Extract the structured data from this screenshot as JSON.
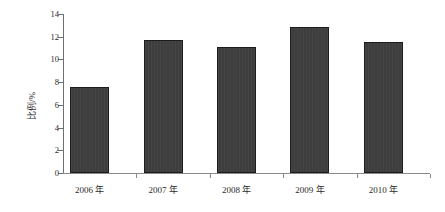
{
  "chart_data": {
    "type": "bar",
    "title": "",
    "xlabel": "",
    "ylabel": "比例/%",
    "categories": [
      "2006 年",
      "2007 年",
      "2008 年",
      "2009 年",
      "2010 年"
    ],
    "values": [
      7.6,
      11.7,
      11.1,
      12.9,
      11.5
    ],
    "ylim": [
      0,
      14
    ],
    "ytick_labels": [
      "0",
      "2",
      "4",
      "6",
      "8",
      "10",
      "12",
      "14"
    ],
    "ytick_values": [
      0,
      2,
      4,
      6,
      8,
      10,
      12,
      14
    ],
    "grid": false,
    "legend": null,
    "series": [
      {
        "name": "比例",
        "values": [
          7.6,
          11.7,
          11.1,
          12.9,
          11.5
        ]
      }
    ],
    "colors": {
      "bar_fill": "#3d3d3d",
      "bar_border": "#1c1c1c",
      "axis": "#6f6f6f",
      "text": "#2b2b2b",
      "background": "#ffffff"
    }
  }
}
